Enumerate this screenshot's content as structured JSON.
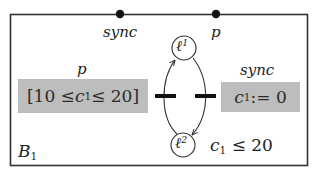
{
  "component": {
    "name": "B",
    "name_subscript": "1",
    "border_color": "#333333"
  },
  "ports": [
    {
      "id": "port-sync",
      "label": "sync"
    },
    {
      "id": "port-p",
      "label": "p"
    }
  ],
  "locations": [
    {
      "id": "l1",
      "symbol": "ℓ",
      "superscript": "1"
    },
    {
      "id": "l2",
      "symbol": "ℓ",
      "superscript": "2"
    }
  ],
  "transitions": [
    {
      "id": "t-p",
      "port_label": "p",
      "guard": {
        "prefix": "[10 ≤ ",
        "var": "c",
        "var_sub": "1",
        "suffix": " ≤ 20]"
      },
      "from": "l2",
      "to": "l1"
    },
    {
      "id": "t-sync",
      "port_label": "sync",
      "action": {
        "var": "c",
        "var_sub": "1",
        "suffix": " := 0"
      },
      "from": "l1",
      "to": "l2"
    }
  ],
  "invariant": {
    "var": "c",
    "var_sub": "1",
    "suffix": " ≤ 20"
  },
  "colors": {
    "guard_fill": "#bdbdbd",
    "line": "#333333",
    "text": "#222222",
    "background": "#ffffff"
  }
}
